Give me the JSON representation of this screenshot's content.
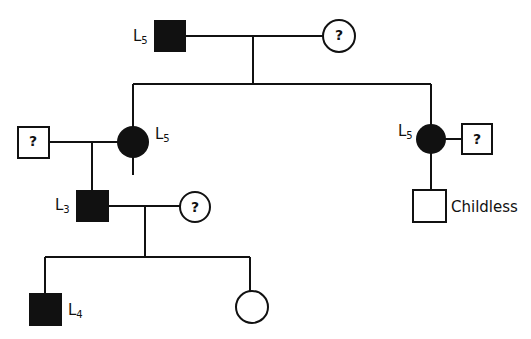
{
  "diagram": {
    "type": "pedigree",
    "generations": [
      {
        "level": 1,
        "members": [
          {
            "id": "g1_father",
            "sex": "male",
            "affected": true,
            "label": "L",
            "sub": "5"
          },
          {
            "id": "g1_mother",
            "sex": "female",
            "affected": false,
            "unknown": true,
            "mark": "?"
          }
        ]
      },
      {
        "level": 2,
        "members": [
          {
            "id": "g2_spouse_left",
            "sex": "male",
            "affected": false,
            "unknown": true,
            "mark": "?"
          },
          {
            "id": "g2_daughter_left",
            "sex": "female",
            "affected": true,
            "label": "L",
            "sub": "5"
          },
          {
            "id": "g2_daughter_right",
            "sex": "female",
            "affected": true,
            "label": "L",
            "sub": "5"
          },
          {
            "id": "g2_spouse_right",
            "sex": "male",
            "affected": false,
            "unknown": true,
            "mark": "?"
          }
        ]
      },
      {
        "level": 3,
        "members": [
          {
            "id": "g3_son_left",
            "sex": "male",
            "affected": true,
            "label": "L",
            "sub": "3"
          },
          {
            "id": "g3_spouse",
            "sex": "female",
            "affected": false,
            "unknown": true,
            "mark": "?"
          },
          {
            "id": "g3_son_right",
            "sex": "male",
            "affected": false,
            "note": "Childless"
          }
        ]
      },
      {
        "level": 4,
        "members": [
          {
            "id": "g4_son",
            "sex": "male",
            "affected": true,
            "label": "L",
            "sub": "4"
          },
          {
            "id": "g4_daughter",
            "sex": "female",
            "affected": false
          }
        ]
      }
    ]
  },
  "labels": {
    "g1_father": {
      "L": "L",
      "sub": "5"
    },
    "g2_left": {
      "L": "L",
      "sub": "5"
    },
    "g2_right": {
      "L": "L",
      "sub": "5"
    },
    "g3_left": {
      "L": "L",
      "sub": "3"
    },
    "g4_son": {
      "L": "L",
      "sub": "4"
    },
    "childless": "Childless",
    "unknown": "?"
  }
}
